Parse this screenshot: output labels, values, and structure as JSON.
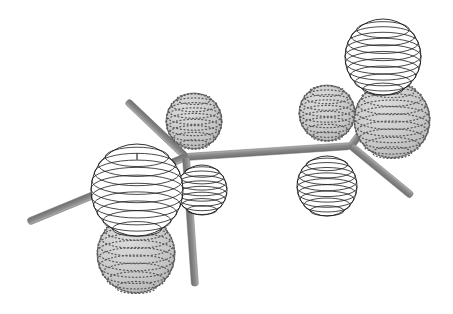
{
  "figure": {
    "domain": "Diagram",
    "kind": "molecular-orbital-lobe-diagram",
    "title": "",
    "caption": "",
    "background_color": "#ffffff",
    "canvas": {
      "width": 453,
      "height": 314
    }
  },
  "palette": {
    "bond_fill": "#8c8c8c",
    "bond_edge_light": "#a8a8a8",
    "bond_edge_dark": "#6f6f6f",
    "lobe_positive_fill": "#ffffff",
    "lobe_positive_stroke": "#1a1a1a",
    "lobe_negative_fill": "#c9c9c9",
    "lobe_negative_stroke": "#6b6b6b",
    "stipple_dot": "#5a5a5a"
  },
  "centers": [
    {
      "id": "center-left",
      "label": "",
      "x": 186,
      "y": 157,
      "note": "left tetrahedral junction"
    },
    {
      "id": "center-right",
      "label": "",
      "x": 351,
      "y": 146,
      "note": "right tetrahedral junction"
    }
  ],
  "bonds": [
    {
      "id": "bond-backbone",
      "name": "central-bond",
      "x1": 186,
      "y1": 157,
      "x2": 351,
      "y2": 146,
      "width": 7
    },
    {
      "id": "bond-left-upleft",
      "name": "left-upper-left-bond",
      "x1": 186,
      "y1": 157,
      "x2": 127,
      "y2": 101,
      "width": 7
    },
    {
      "id": "bond-left-west",
      "name": "left-horizontal-bond",
      "x1": 186,
      "y1": 157,
      "x2": 28,
      "y2": 222,
      "width": 7
    },
    {
      "id": "bond-left-downright",
      "name": "left-lower-right-bond",
      "x1": 186,
      "y1": 157,
      "x2": 195,
      "y2": 286,
      "width": 7
    },
    {
      "id": "bond-right-upright",
      "name": "right-upper-right-bond",
      "x1": 351,
      "y1": 146,
      "x2": 392,
      "y2": 92,
      "width": 7
    },
    {
      "id": "bond-right-downright",
      "name": "right-lower-right-bond",
      "x1": 351,
      "y1": 146,
      "x2": 412,
      "y2": 196,
      "width": 7
    }
  ],
  "lobes": [
    {
      "id": "lobe-left-large-white",
      "name": "left-large-positive-lobe",
      "phase": "positive",
      "style": "latitude-rings",
      "cx": 137,
      "cy": 190,
      "r": 46,
      "rings": 9,
      "pole_tick": true,
      "z": 60
    },
    {
      "id": "lobe-left-small-white",
      "name": "left-small-positive-lobe",
      "phase": "positive",
      "style": "latitude-rings",
      "cx": 202,
      "cy": 190,
      "r": 25,
      "rings": 7,
      "pole_tick": false,
      "z": 55
    },
    {
      "id": "lobe-left-upper-stipple",
      "name": "left-upper-negative-lobe",
      "phase": "negative",
      "style": "stippled",
      "cx": 194,
      "cy": 121,
      "r": 28,
      "rings": 8,
      "z": 20
    },
    {
      "id": "lobe-left-lower-stipple",
      "name": "left-lower-negative-lobe",
      "phase": "negative",
      "style": "stippled",
      "cx": 136,
      "cy": 254,
      "r": 39,
      "rings": 9,
      "z": 25
    },
    {
      "id": "lobe-right-top-white",
      "name": "right-top-positive-lobe",
      "phase": "positive",
      "style": "latitude-rings",
      "cx": 383,
      "cy": 57,
      "r": 38,
      "rings": 9,
      "pole_tick": false,
      "z": 65
    },
    {
      "id": "lobe-right-lower-white",
      "name": "right-lower-positive-lobe",
      "phase": "positive",
      "style": "latitude-rings",
      "cx": 327,
      "cy": 186,
      "r": 30,
      "rings": 8,
      "pole_tick": false,
      "z": 58
    },
    {
      "id": "lobe-right-left-stipple",
      "name": "right-back-negative-lobe",
      "phase": "negative",
      "style": "stippled",
      "cx": 327,
      "cy": 113,
      "r": 28,
      "rings": 8,
      "z": 18
    },
    {
      "id": "lobe-right-right-stipple",
      "name": "right-front-negative-lobe",
      "phase": "negative",
      "style": "stippled",
      "cx": 392,
      "cy": 120,
      "r": 38,
      "rings": 9,
      "z": 22
    }
  ],
  "annotations": {
    "pole_marker": "|",
    "labels": []
  }
}
